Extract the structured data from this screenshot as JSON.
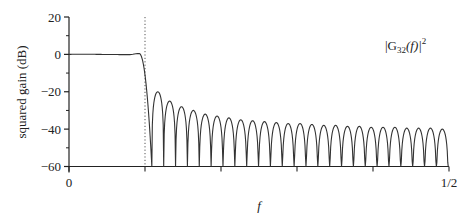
{
  "chart_data": {
    "type": "line",
    "title": "",
    "xlabel": "f",
    "ylabel": "squared gain (dB)",
    "xlim": [
      0,
      0.5
    ],
    "ylim": [
      -60,
      20
    ],
    "x_ticks": [
      0,
      0.1,
      0.2,
      0.3,
      0.4,
      0.5
    ],
    "x_tick_labels": [
      "0",
      "",
      "",
      "",
      "",
      "1/2"
    ],
    "y_ticks": [
      20,
      0,
      -20,
      -40,
      -60
    ],
    "y_tick_labels": [
      "20",
      "0",
      "−20",
      "−40",
      "−60"
    ],
    "y_minor_ticks": [
      10,
      -10,
      -30,
      -50
    ],
    "grid": false,
    "annotation": "|G32(f)|^2",
    "annotation_parts": {
      "pre": "|G",
      "sub": "32",
      "mid": "(f)|",
      "sup": "2"
    },
    "cutoff_line": {
      "f": 0.1,
      "style": "dotted"
    },
    "passband": {
      "f_start": 0.0,
      "f_end": 0.1,
      "level_db": 0,
      "ripple_peak_db": 0.5,
      "ripple_peak_f": 0.09
    },
    "transition": {
      "f_start": 0.092,
      "f_first_null": 0.109
    },
    "stopband": {
      "first_null_f": 0.109,
      "null_spacing_f": 0.0156,
      "null_floor_db": -60,
      "sidelobe_peaks_db": [
        -20,
        -25,
        -28,
        -30,
        -32,
        -33,
        -34,
        -35,
        -35.5,
        -36,
        -36.5,
        -37,
        -37,
        -37.5,
        -38,
        -38,
        -38.5,
        -38.5,
        -39,
        -39,
        -39,
        -39.5,
        -39.5,
        -39.5,
        -40
      ]
    },
    "series": [
      {
        "name": "|G32(f)|^2",
        "color": "#333333"
      }
    ]
  }
}
